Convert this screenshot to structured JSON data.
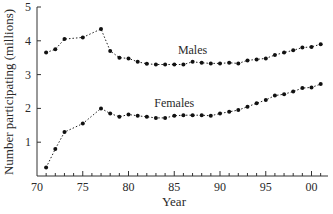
{
  "chart_data": {
    "type": "line",
    "title": "",
    "xlabel": "Year",
    "ylabel": "Number participating (millions)",
    "xlim": [
      70,
      101
    ],
    "ylim": [
      0,
      5
    ],
    "x_ticks": [
      70,
      75,
      80,
      85,
      90,
      95,
      100
    ],
    "x_tick_labels": [
      "70",
      "75",
      "80",
      "85",
      "90",
      "95",
      "00"
    ],
    "y_ticks": [
      1,
      2,
      3,
      4,
      5
    ],
    "y_tick_labels": [
      "1",
      "2",
      "3",
      "4",
      "5"
    ],
    "grid": false,
    "legend": "inline labels",
    "series": [
      {
        "name": "Males",
        "label_pos": {
          "x": 87,
          "y": 3.6
        },
        "x": [
          71,
          72,
          73,
          75,
          77,
          78,
          79,
          80,
          81,
          82,
          83,
          84,
          85,
          86,
          87,
          88,
          89,
          90,
          91,
          92,
          93,
          94,
          95,
          96,
          97,
          98,
          99,
          100,
          101
        ],
        "values": [
          3.65,
          3.75,
          4.05,
          4.1,
          4.35,
          3.7,
          3.5,
          3.48,
          3.38,
          3.32,
          3.3,
          3.3,
          3.3,
          3.3,
          3.38,
          3.35,
          3.33,
          3.33,
          3.35,
          3.33,
          3.42,
          3.45,
          3.48,
          3.58,
          3.65,
          3.72,
          3.8,
          3.82,
          3.9
        ]
      },
      {
        "name": "Females",
        "label_pos": {
          "x": 85,
          "y": 2.05
        },
        "x": [
          71,
          72,
          73,
          75,
          77,
          78,
          79,
          80,
          81,
          82,
          83,
          84,
          85,
          86,
          87,
          88,
          89,
          90,
          91,
          92,
          93,
          94,
          95,
          96,
          97,
          98,
          99,
          100,
          101
        ],
        "values": [
          0.25,
          0.8,
          1.3,
          1.55,
          2.0,
          1.85,
          1.75,
          1.82,
          1.78,
          1.75,
          1.72,
          1.72,
          1.78,
          1.8,
          1.8,
          1.8,
          1.78,
          1.85,
          1.9,
          1.95,
          2.05,
          2.15,
          2.25,
          2.38,
          2.42,
          2.5,
          2.6,
          2.62,
          2.72
        ]
      }
    ]
  },
  "colors": {
    "axis": "#333333",
    "series": "#111111",
    "text": "#2a2a2a",
    "background": "#ffffff"
  }
}
